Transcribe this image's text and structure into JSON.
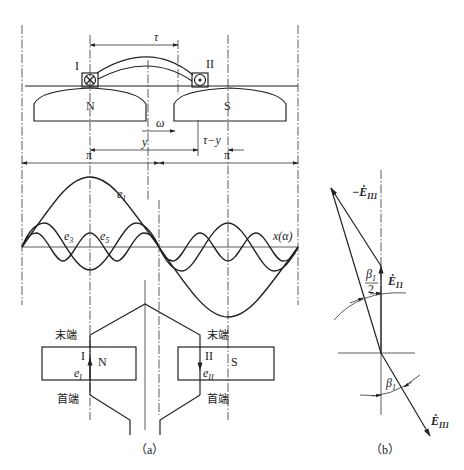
{
  "figure_a": {
    "caption": "（a）",
    "top_labels": {
      "tau": "τ",
      "coil_I": "I",
      "coil_II": "II",
      "pole_N": "N",
      "pole_S": "S",
      "omega": "ω",
      "y": "y",
      "tau_minus_y": "τ−y",
      "pi_left": "π",
      "pi_right": "π"
    },
    "wave_labels": {
      "e1": "e",
      "e1_sub": "1",
      "e3": "e",
      "e3_sub": "3",
      "e5": "e",
      "e5_sub": "5",
      "x_axis": "x(α)"
    },
    "coil_labels": {
      "end_left": "末端",
      "end_right": "末端",
      "start_left": "首端",
      "start_right": "首端",
      "coil_I": "I",
      "coil_II": "II",
      "pole_N": "N",
      "pole_S": "S",
      "eI": "e",
      "eI_sub": "I",
      "eII": "e",
      "eII_sub": "II"
    }
  },
  "figure_b": {
    "caption": "（b）",
    "labels": {
      "neg_E_II1": "−Ė",
      "neg_E_II1_sub": "II1",
      "E_I1": "Ė",
      "E_I1_sub": "I1",
      "E_II1": "Ė",
      "E_II1_sub": "II1",
      "beta_half_num": "β",
      "beta_half_sub": "1",
      "beta_half_den": "2",
      "beta": "β",
      "beta_sub": "1"
    }
  }
}
